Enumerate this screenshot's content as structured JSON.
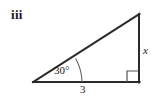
{
  "figure": {
    "item_label": "iii",
    "type": "right-triangle-diagram",
    "background_color": "#ffffff",
    "stroke_color": "#2a2a2a",
    "arc_color": "#555555",
    "labels": {
      "angle": "30°",
      "base": "3",
      "side": "x"
    },
    "geometry": {
      "vertex_left": [
        33,
        82
      ],
      "vertex_right": [
        139,
        82
      ],
      "vertex_top": [
        139,
        14
      ],
      "base_line": "from (33,82) to (139,82)",
      "vertical_line": "from (139,82) to (139,14)",
      "hypotenuse_line": "from (33,82) to (139,14)",
      "angle_arc_radius": 49,
      "right_angle_marker": "square at bottom-right vertex, size 11px"
    }
  }
}
